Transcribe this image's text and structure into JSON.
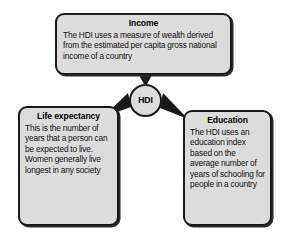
{
  "diagram": {
    "type": "hub-and-spoke-concept-map",
    "hub": {
      "label": "HDI"
    },
    "nodes": [
      {
        "id": "income",
        "title": "Income",
        "body": "The HDI uses a measure of wealth derived from the estimated per capita gross national income of a country",
        "position": "top"
      },
      {
        "id": "life-expectancy",
        "title": "Life expectancy",
        "body": "This is the number of years that a person can be expected to live. Women generally live longest in any society",
        "position": "bottom-left"
      },
      {
        "id": "education",
        "title": "Education",
        "body": "The HDI uses an education index based on the average number of years of schooling for people in a country",
        "position": "bottom-right"
      }
    ],
    "connectors": [
      {
        "from": "income",
        "to": "HDI",
        "shape": "arrow-down"
      },
      {
        "from": "life-expectancy",
        "to": "HDI",
        "shape": "arrow-up-right"
      },
      {
        "from": "education",
        "to": "HDI",
        "shape": "arrow-up-left"
      }
    ],
    "colors": {
      "background": "#ffffff",
      "box_fill": "#dcdcdc",
      "box_border": "#1a1a1a",
      "text": "#000000",
      "arrow": "#1a1a1a"
    }
  }
}
